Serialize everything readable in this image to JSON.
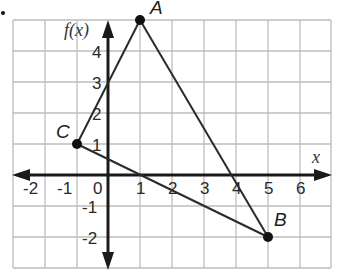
{
  "diagram": {
    "type": "coordinate-plane-triangle",
    "axes": {
      "x_label": "x",
      "y_label": "f(x)"
    },
    "x_ticks": [
      "-2",
      "-1",
      "0",
      "1",
      "2",
      "3",
      "4",
      "5",
      "6"
    ],
    "y_ticks": [
      "4",
      "3",
      "2",
      "1",
      "-1",
      "-2"
    ],
    "grid": {
      "x_range": [
        -3,
        7
      ],
      "y_range": [
        -3,
        5
      ],
      "step": 1
    },
    "points": [
      {
        "label": "A",
        "x": 1,
        "y": 5
      },
      {
        "label": "B",
        "x": 5,
        "y": -2
      },
      {
        "label": "C",
        "x": -1,
        "y": 1
      }
    ],
    "segments": [
      [
        "C",
        "A"
      ],
      [
        "A",
        "B"
      ],
      [
        "B",
        "C"
      ]
    ],
    "colors": {
      "grid": "#b8b8b8",
      "axis": "#1a1a1a",
      "line": "#2a2a2a",
      "point": "#111111"
    }
  }
}
